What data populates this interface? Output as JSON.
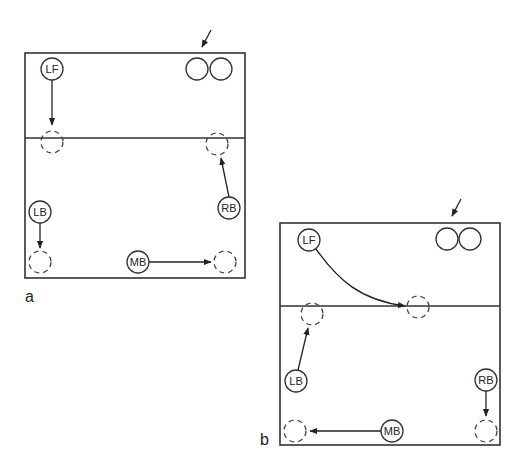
{
  "figure": {
    "panels": [
      {
        "id": "a",
        "label": "a",
        "players": {
          "lf": "LF",
          "lb": "LB",
          "mb": "MB",
          "rb": "RB"
        }
      },
      {
        "id": "b",
        "label": "b",
        "players": {
          "lf": "LF",
          "lb": "LB",
          "mb": "MB",
          "rb": "RB"
        }
      }
    ],
    "colors": {
      "line": "#333333",
      "background": "#ffffff"
    }
  }
}
